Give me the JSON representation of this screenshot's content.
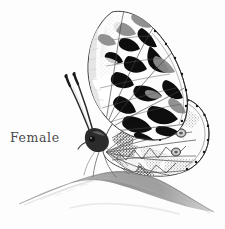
{
  "image": {
    "kind": "pencil-illustration",
    "subject": "butterfly",
    "species_pattern": "marbled-white",
    "view": "lateral, wings closed",
    "background_color": "#fdfdfd",
    "width": 225,
    "height": 229
  },
  "caption": {
    "label": "Female"
  },
  "palette": {
    "background": "#fdfdfd",
    "ink_black": "#111111",
    "ink_dark": "#2c2c2c",
    "ink_mid": "#6f6f6f",
    "ink_light": "#a8a8a8",
    "ink_faint": "#cfcfcf",
    "wing_white": "#fbfbfb",
    "shade_gray": "#8c8c8c",
    "grass_gray": "#9a9a9a"
  },
  "elements": {
    "forewing_label": "forewing",
    "hindwing_label": "hindwing",
    "antennae_label": "antennae",
    "head_label": "head",
    "legs_label": "legs",
    "grass_blade_label": "grass blade"
  }
}
